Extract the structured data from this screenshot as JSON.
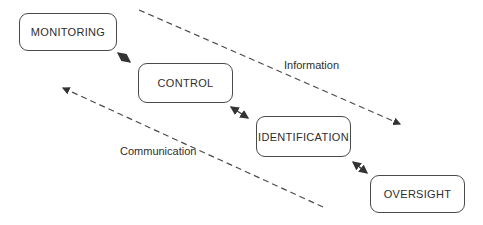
{
  "canvas": {
    "background_color": "#ffffff",
    "ink_color": "#3a3a3a"
  },
  "boxes": [
    {
      "id": "monitoring",
      "label": "MONITORING"
    },
    {
      "id": "control",
      "label": "CONTROL"
    },
    {
      "id": "identification",
      "label": "IDENTIFICATION"
    },
    {
      "id": "oversight",
      "label": "OVERSIGHT"
    }
  ],
  "connectors": [
    {
      "from": "MONITORING",
      "to": "CONTROL",
      "type": "double-headed-arrow"
    },
    {
      "from": "CONTROL",
      "to": "IDENTIFICATION",
      "type": "double-headed-arrow"
    },
    {
      "from": "IDENTIFICATION",
      "to": "OVERSIGHT",
      "type": "double-headed-arrow"
    }
  ],
  "flows": [
    {
      "id": "information",
      "label": "Information",
      "style": "dashed",
      "arrow_direction": "down-right"
    },
    {
      "id": "communication",
      "label": "Communication",
      "style": "dashed",
      "arrow_direction": "up-left"
    }
  ]
}
